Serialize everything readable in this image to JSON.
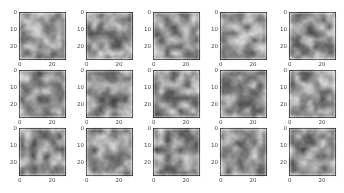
{
  "chart_data": {
    "type": "heatmap",
    "title": "",
    "layout": {
      "rows": 3,
      "cols": 5
    },
    "image_size": [
      28,
      28
    ],
    "colormap": "gray",
    "xticks": [
      "0",
      "20"
    ],
    "yticks": [
      "0",
      "10",
      "20"
    ],
    "panels": 15
  }
}
